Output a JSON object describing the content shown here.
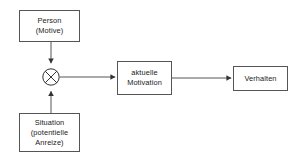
{
  "diagram": {
    "background_color": "#ffffff",
    "stroke_color": "#555555",
    "text_color": "#1a1a1a",
    "nodes": [
      {
        "id": "person",
        "shape": "rectangle",
        "lines": [
          "Person",
          "(Motive)"
        ]
      },
      {
        "id": "situation",
        "shape": "rectangle",
        "lines": [
          "Situation",
          "(potentielle",
          "Anreize)"
        ]
      },
      {
        "id": "operator",
        "shape": "circle-with-cross",
        "symbol": "multiplication-operator",
        "lines": []
      },
      {
        "id": "motivation",
        "shape": "rectangle",
        "lines": [
          "aktuelle",
          "Motivation"
        ]
      },
      {
        "id": "verhalten",
        "shape": "rectangle",
        "lines": [
          "Verhalten"
        ]
      }
    ],
    "edges": [
      {
        "id": "person-to-operator",
        "from": "person",
        "to": "operator",
        "direction": "down",
        "label": ""
      },
      {
        "id": "situation-to-operator",
        "from": "situation",
        "to": "operator",
        "direction": "up",
        "label": ""
      },
      {
        "id": "operator-to-motivation",
        "from": "operator",
        "to": "motivation",
        "direction": "right",
        "label": ""
      },
      {
        "id": "motivation-to-verhalten",
        "from": "motivation",
        "to": "verhalten",
        "direction": "right",
        "label": ""
      }
    ]
  }
}
